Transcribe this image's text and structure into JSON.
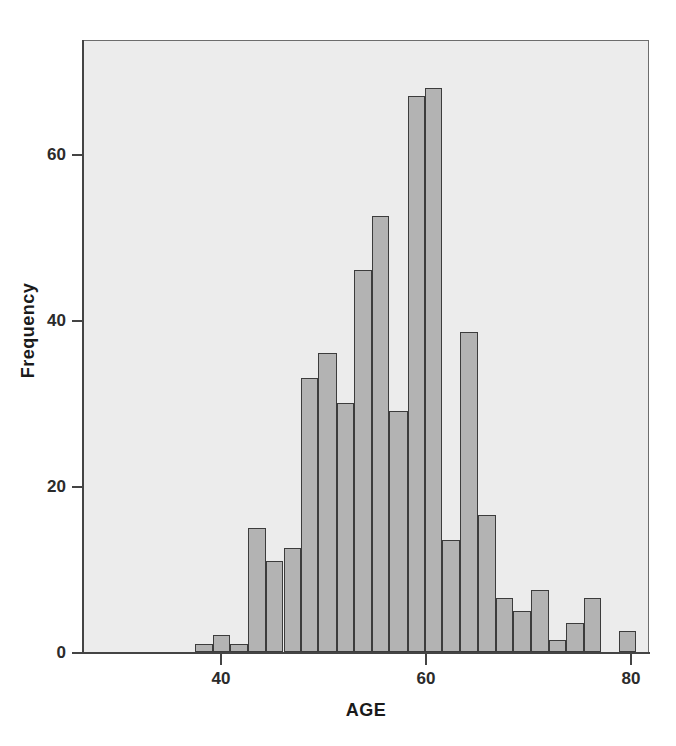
{
  "chart_data": {
    "type": "bar",
    "title": "",
    "subtitle": "",
    "xlabel": "AGE",
    "ylabel": "Frequency",
    "xlim": [
      32.5,
      81.5
    ],
    "ylim": [
      0,
      73
    ],
    "grid": false,
    "legend": null,
    "bin_width": 1.75,
    "x_ticks": [
      40,
      60,
      80
    ],
    "x_tick_labels": [
      "40",
      "60",
      "80"
    ],
    "y_ticks": [
      0,
      20,
      40,
      60
    ],
    "y_tick_labels": [
      "0",
      "20",
      "40",
      "60"
    ],
    "bar_fill_color": "#b3b3b3",
    "bar_edge_color": "#3c3c3c",
    "plot_background_color": "#ececec",
    "page_background_color": "#ffffff",
    "categories": [
      "37.4",
      "39.1",
      "40.8",
      "42.5",
      "44.3",
      "46.0",
      "47.7",
      "49.4",
      "51.2",
      "52.9",
      "54.6",
      "56.3",
      "58.1",
      "59.8",
      "61.5",
      "63.2",
      "65.0",
      "66.7",
      "68.4",
      "70.1",
      "71.9",
      "73.6",
      "75.3",
      "77.0"
    ],
    "values": [
      1,
      2,
      1,
      15,
      11,
      12.5,
      33,
      36,
      30,
      46,
      52.5,
      29,
      67,
      68,
      13.5,
      38.5,
      16.5,
      6.5,
      5,
      7.5,
      1.5,
      3.5,
      6.5,
      2.5
    ],
    "bars": [
      {
        "x_left": 37.4,
        "x_right": 39.1,
        "value": 1
      },
      {
        "x_left": 39.1,
        "x_right": 40.8,
        "value": 2
      },
      {
        "x_left": 40.8,
        "x_right": 42.5,
        "value": 1
      },
      {
        "x_left": 42.5,
        "x_right": 44.3,
        "value": 15
      },
      {
        "x_left": 44.3,
        "x_right": 46.0,
        "value": 11
      },
      {
        "x_left": 46.0,
        "x_right": 47.7,
        "value": 12.5
      },
      {
        "x_left": 47.7,
        "x_right": 49.4,
        "value": 33
      },
      {
        "x_left": 49.4,
        "x_right": 51.2,
        "value": 36
      },
      {
        "x_left": 51.2,
        "x_right": 52.9,
        "value": 30
      },
      {
        "x_left": 52.9,
        "x_right": 54.6,
        "value": 46
      },
      {
        "x_left": 54.6,
        "x_right": 56.3,
        "value": 52.5
      },
      {
        "x_left": 56.3,
        "x_right": 58.1,
        "value": 29
      },
      {
        "x_left": 58.1,
        "x_right": 59.8,
        "value": 67
      },
      {
        "x_left": 59.8,
        "x_right": 61.5,
        "value": 68
      },
      {
        "x_left": 61.5,
        "x_right": 63.2,
        "value": 13.5
      },
      {
        "x_left": 63.2,
        "x_right": 65.0,
        "value": 38.5
      },
      {
        "x_left": 65.0,
        "x_right": 66.7,
        "value": 16.5
      },
      {
        "x_left": 66.7,
        "x_right": 68.4,
        "value": 6.5
      },
      {
        "x_left": 68.4,
        "x_right": 70.1,
        "value": 5
      },
      {
        "x_left": 70.1,
        "x_right": 71.9,
        "value": 7.5
      },
      {
        "x_left": 71.9,
        "x_right": 73.6,
        "value": 1.5
      },
      {
        "x_left": 73.6,
        "x_right": 75.3,
        "value": 3.5
      },
      {
        "x_left": 75.3,
        "x_right": 77.0,
        "value": 6.5
      },
      {
        "x_left": 78.7,
        "x_right": 80.4,
        "value": 2.5
      }
    ]
  }
}
